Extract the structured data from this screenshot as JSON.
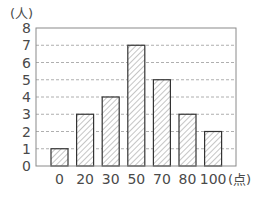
{
  "chart_data": {
    "type": "bar",
    "title": "",
    "xlabel": "(点)",
    "ylabel": "(人)",
    "categories": [
      "0",
      "20",
      "30",
      "50",
      "70",
      "80",
      "100"
    ],
    "values": [
      1,
      3,
      4,
      7,
      5,
      3,
      2
    ],
    "ylim": [
      0,
      8
    ],
    "yticks": [
      0,
      1,
      2,
      3,
      4,
      5,
      6,
      7,
      8
    ],
    "grid": "horizontal dashed",
    "bar_fill": "hatched diagonal",
    "legend": null
  },
  "colors": {
    "axis": "#8a8a8a",
    "grid": "#9a9a9a",
    "bar_border": "#333333",
    "hatch": "#8c8c8c",
    "text": "#4a4a4a"
  }
}
